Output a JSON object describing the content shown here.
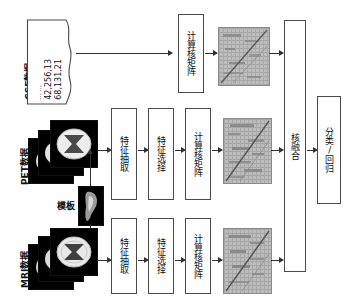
{
  "diagram": {
    "nodes": {
      "csf_label": "CSF数据",
      "csf_values_line1": "68,131,21",
      "csf_values_line2": "42,256,13",
      "csf_values_ellipsis": "……",
      "pet_label": "PET数据",
      "mri_label": "MRI数据",
      "template_label": "模板",
      "feature_extraction": "特征抽取",
      "feature_selection": "特征选择",
      "compute_kernel_matrix": "计算核矩阵",
      "kernel_fusion": "核融合",
      "classification_regression": "分类/回归",
      "kernel_matrix_csf": "核矩阵图-CSF",
      "kernel_matrix_pet": "核矩阵图-PET",
      "kernel_matrix_mri": "核矩阵图-MRI"
    },
    "colors": {
      "stroke": "#4a4a4a",
      "arrow": "#333333",
      "background": "#ffffff",
      "matrix_base": "#b9b9b9",
      "image_background": "#000000"
    }
  }
}
